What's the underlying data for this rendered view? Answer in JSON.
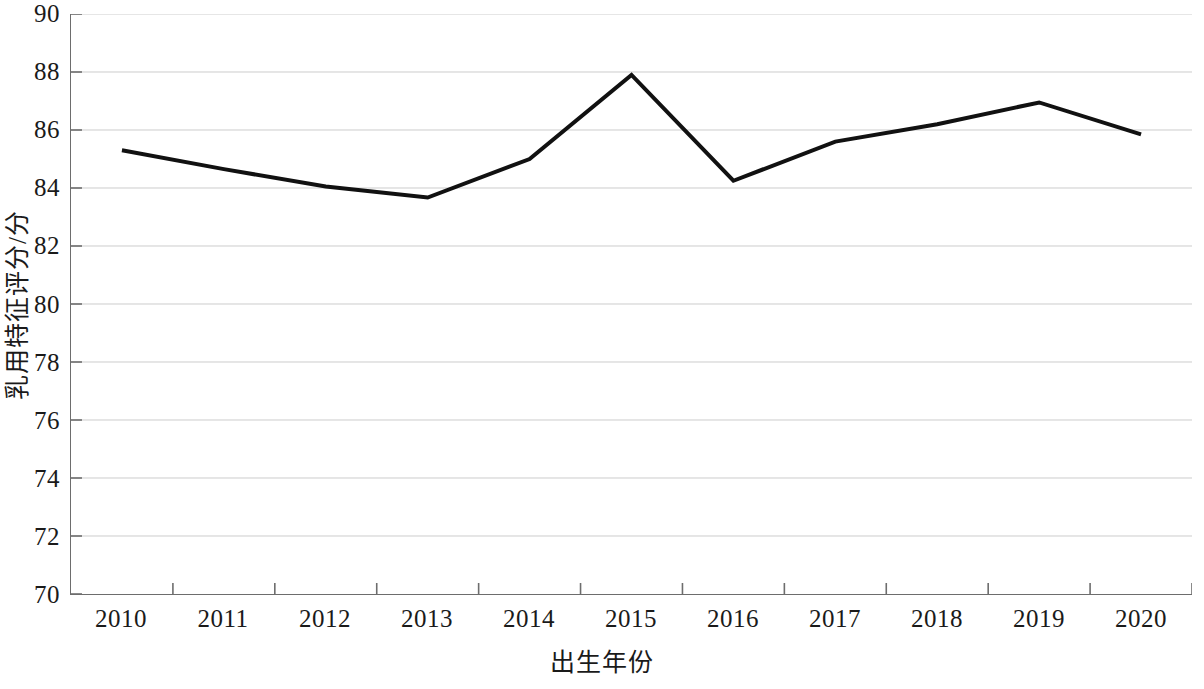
{
  "chart_data": {
    "type": "line",
    "title": "",
    "subtitle": "",
    "xlabel": "出生年份",
    "ylabel": "乳用特征评分/分",
    "categories": [
      "2010",
      "2011",
      "2012",
      "2013",
      "2014",
      "2015",
      "2016",
      "2017",
      "2018",
      "2019",
      "2020"
    ],
    "values": [
      85.3,
      84.65,
      84.05,
      83.67,
      85.0,
      87.9,
      84.25,
      85.6,
      86.2,
      86.95,
      85.85
    ],
    "series": [
      {
        "name": "乳用特征评分",
        "values": [
          85.3,
          84.65,
          84.05,
          83.67,
          85.0,
          87.9,
          84.25,
          85.6,
          86.2,
          86.95,
          85.85
        ],
        "color": "#111111"
      }
    ],
    "ylim": [
      70,
      90
    ],
    "ytick_step": 2,
    "yticks": [
      90,
      88,
      86,
      84,
      82,
      80,
      78,
      76,
      74,
      72,
      70
    ],
    "ytick_labels": [
      "90",
      "88",
      "86",
      "84",
      "82",
      "80",
      "78",
      "76",
      "74",
      "72",
      "70"
    ],
    "xticks": [
      "2010",
      "2011",
      "2012",
      "2013",
      "2014",
      "2015",
      "2016",
      "2017",
      "2018",
      "2019",
      "2020"
    ],
    "grid": true,
    "grid_axis": "y",
    "grid_color": "#cccccc",
    "axis_color": "#6d6d6d",
    "legend": false,
    "legend_position": "none",
    "markers": false,
    "line_width": 4,
    "background": "#ffffff",
    "annotations": []
  }
}
